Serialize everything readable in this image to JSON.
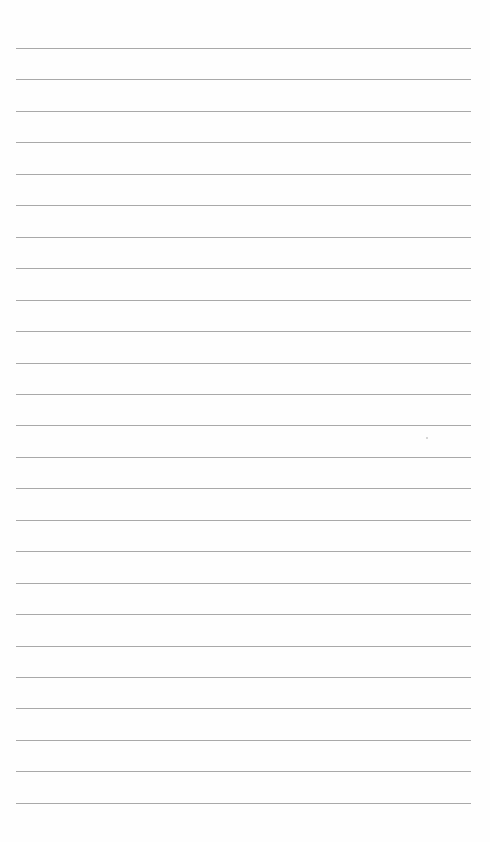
{
  "page": {
    "type": "lined-paper",
    "background_color": "#fefefe",
    "line_color": "#a9a9a9",
    "line_count": 25,
    "first_line_y": 48,
    "line_spacing": 31.45,
    "line_left": 16,
    "line_right": 471
  },
  "marks": [
    {
      "x": 426,
      "y": 437
    }
  ]
}
